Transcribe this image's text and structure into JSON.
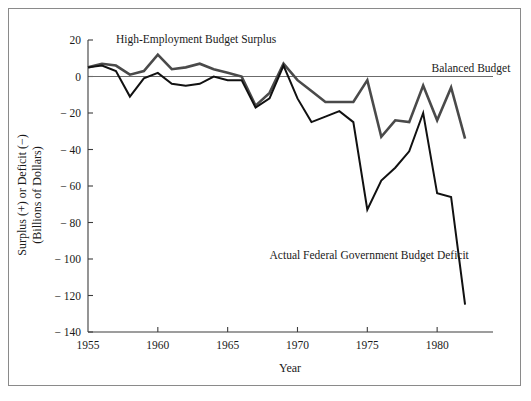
{
  "figure": {
    "frame_border_color": "#8a8a8a",
    "background": "#ffffff"
  },
  "chart_data": {
    "type": "line",
    "title": "",
    "subtitle": "",
    "xlabel": "Year",
    "ylabel": "Surplus (+) or Deficit (−)",
    "ylabel_line2": "(Billions of Dollars)",
    "xlim": [
      1955,
      1984
    ],
    "ylim": [
      -140,
      20
    ],
    "ytick_labels": [
      "20",
      "0",
      "− 20",
      "− 40",
      "− 60",
      "− 80",
      "− 100",
      "− 120",
      "− 140"
    ],
    "yticks": [
      20,
      0,
      -20,
      -40,
      -60,
      -80,
      -100,
      -120,
      -140
    ],
    "xtick_labels": [
      "1955",
      "1960",
      "1965",
      "1970",
      "1975",
      "1980"
    ],
    "xticks": [
      1955,
      1960,
      1965,
      1970,
      1975,
      1980
    ],
    "grid": false,
    "legend_position": "inline-annotations",
    "annotations": [
      {
        "name": "high-employment-budget-surplus-label",
        "text": "High-Employment Budget Surplus",
        "x": 1957.0,
        "y": 18.5
      },
      {
        "name": "balanced-budget-label",
        "text": "Balanced Budget",
        "x": 1979.6,
        "y": 2.5
      },
      {
        "name": "actual-federal-budget-deficit-label",
        "text": "Actual Federal Government Budget Deficit",
        "x": 1968.0,
        "y": -100.0
      }
    ],
    "reference_line": {
      "name": "balanced-budget-line",
      "value": 0,
      "color": "#6b6b6b"
    },
    "x": [
      1955,
      1956,
      1957,
      1958,
      1959,
      1960,
      1961,
      1962,
      1963,
      1964,
      1965,
      1966,
      1967,
      1968,
      1969,
      1970,
      1971,
      1972,
      1973,
      1974,
      1975,
      1976,
      1977,
      1978,
      1979,
      1980,
      1981,
      1982
    ],
    "series": [
      {
        "name": "High-Employment Budget Surplus",
        "color": "#4a4a4a",
        "values": [
          5,
          7,
          6,
          1,
          3,
          12,
          4,
          5,
          7,
          4,
          2,
          0,
          -16,
          -9,
          7,
          -2,
          -8,
          -14,
          -14,
          -14,
          -2,
          -33,
          -24,
          -25,
          -5,
          -24,
          -6,
          -34
        ]
      },
      {
        "name": "Actual Federal Government Budget Deficit",
        "color": "#111111",
        "values": [
          5,
          6,
          3,
          -11,
          -1,
          2,
          -4,
          -5,
          -4,
          0,
          -2,
          -2,
          -17,
          -12,
          6,
          -12,
          -25,
          -22,
          -19,
          -25,
          -73,
          -57,
          -50,
          -41,
          -20,
          -64,
          -66,
          -125
        ]
      }
    ]
  },
  "axes": {
    "y_axis_name": "y-axis",
    "x_axis_name": "x-axis"
  }
}
